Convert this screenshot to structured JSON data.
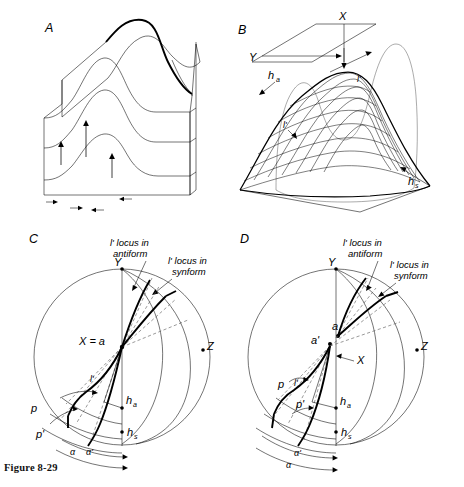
{
  "figure": {
    "caption": "Figure 8-29",
    "panels": [
      {
        "id": "A",
        "letter": "A",
        "name": "block-diagram-folded-layers",
        "labels": []
      },
      {
        "id": "B",
        "letter": "B",
        "name": "mesh-surface-diagram",
        "labels": [
          {
            "key": "X",
            "text": "X"
          },
          {
            "key": "Y",
            "text": "Y"
          },
          {
            "key": "ha",
            "text": "h",
            "sub": "a"
          },
          {
            "key": "hs",
            "text": "h",
            "sub": "s"
          },
          {
            "key": "lp1",
            "text": "l'"
          },
          {
            "key": "lp2",
            "text": "l'"
          }
        ]
      },
      {
        "id": "C",
        "letter": "C",
        "name": "stereonet-projection-c",
        "labels": [
          {
            "key": "Y",
            "text": "Y"
          },
          {
            "key": "Z",
            "text": "Z"
          },
          {
            "key": "Xa",
            "text": "X = a"
          },
          {
            "key": "ha",
            "text": "h",
            "sub": "a"
          },
          {
            "key": "hs",
            "text": "h",
            "sub": "s"
          },
          {
            "key": "p",
            "text": "p"
          },
          {
            "key": "pp",
            "text": "p'"
          },
          {
            "key": "lp",
            "text": "l'"
          },
          {
            "key": "al",
            "text": "α"
          },
          {
            "key": "alp",
            "text": "α'"
          }
        ],
        "annotations": [
          {
            "key": "anti",
            "line1": "l' locus in",
            "line2": "antiform"
          },
          {
            "key": "syn",
            "line1": "l' locus in",
            "line2": "synform"
          }
        ]
      },
      {
        "id": "D",
        "letter": "D",
        "name": "stereonet-projection-d",
        "labels": [
          {
            "key": "Y",
            "text": "Y"
          },
          {
            "key": "Z",
            "text": "Z"
          },
          {
            "key": "X",
            "text": "X"
          },
          {
            "key": "a",
            "text": "a"
          },
          {
            "key": "ap",
            "text": "a'"
          },
          {
            "key": "ha",
            "text": "h",
            "sub": "a"
          },
          {
            "key": "hs",
            "text": "h",
            "sub": "s"
          },
          {
            "key": "p",
            "text": "p"
          },
          {
            "key": "pp",
            "text": "p'"
          },
          {
            "key": "lp",
            "text": "l'"
          },
          {
            "key": "al",
            "text": "α"
          },
          {
            "key": "alp",
            "text": "α'"
          }
        ],
        "annotations": [
          {
            "key": "anti",
            "line1": "l' locus in",
            "line2": "antiform"
          },
          {
            "key": "syn",
            "line1": "l' locus in",
            "line2": "synform"
          }
        ]
      }
    ]
  },
  "colors": {
    "ink": "#000000",
    "paper": "#ffffff",
    "faint": "#555555"
  }
}
